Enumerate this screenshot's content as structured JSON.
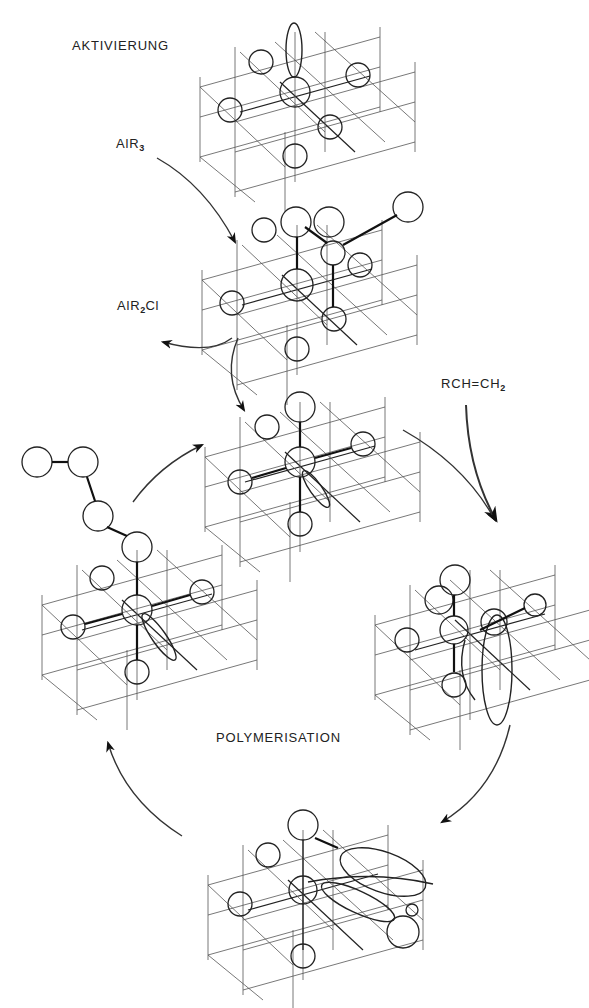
{
  "labels": {
    "activation": "AKTIVIERUNG",
    "alr3_main": "AlR",
    "alr3_sub": "3",
    "alr2cl_pre": "AlR",
    "alr2cl_sub": "2",
    "alr2cl_post": "Cl",
    "monomer_pre": "RCH=CH",
    "monomer_sub": "2",
    "polymerisation": "POLYMERISATION"
  },
  "structures": [
    {
      "id": "ti-surface-vacant-orbital",
      "stage": "activation",
      "cx": 295,
      "cy": 90
    },
    {
      "id": "ti-alkyl-alr3-complex",
      "stage": "activation",
      "cx": 295,
      "cy": 255
    },
    {
      "id": "active-center",
      "stage": "polymerisation",
      "cx": 295,
      "cy": 462
    },
    {
      "id": "olefin-coordination",
      "stage": "polymerisation",
      "cx": 470,
      "cy": 640
    },
    {
      "id": "insertion-transition",
      "stage": "polymerisation",
      "cx": 300,
      "cy": 885
    },
    {
      "id": "chain-grown",
      "stage": "polymerisation",
      "cx": 137,
      "cy": 610
    }
  ],
  "arrows": [
    {
      "id": "alr3-in",
      "from": "AlR3",
      "to": "ti-alkyl-alr3-complex"
    },
    {
      "id": "alr2cl-out",
      "from": "ti-alkyl-alr3-complex",
      "to": "AlR2Cl"
    },
    {
      "id": "to-active-center",
      "from": "ti-alkyl-alr3-complex",
      "to": "active-center"
    },
    {
      "id": "monomer-in",
      "from": "RCH=CH2",
      "to": "olefin-coordination"
    },
    {
      "id": "cycle-1",
      "from": "active-center",
      "to": "olefin-coordination"
    },
    {
      "id": "cycle-2",
      "from": "olefin-coordination",
      "to": "insertion-transition"
    },
    {
      "id": "cycle-3",
      "from": "insertion-transition",
      "to": "chain-grown"
    },
    {
      "id": "cycle-4",
      "from": "chain-grown",
      "to": "active-center"
    }
  ]
}
